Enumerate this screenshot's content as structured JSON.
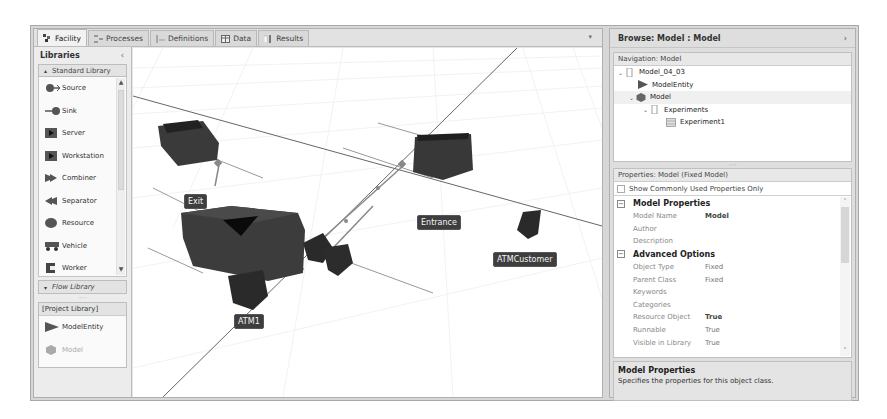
{
  "tabs": [
    {
      "label": "Facility",
      "icon": "facility-icon",
      "active": true
    },
    {
      "label": "Processes",
      "icon": "processes-icon",
      "active": false
    },
    {
      "label": "Definitions",
      "icon": "definitions-icon",
      "active": false
    },
    {
      "label": "Data",
      "icon": "data-table-icon",
      "active": false
    },
    {
      "label": "Results",
      "icon": "results-icon",
      "active": false
    }
  ],
  "tab_menu_arrow": "▾",
  "libraries": {
    "title": "Libraries",
    "collapse_glyph": "‹",
    "standard": {
      "label": "Standard Library",
      "toggle_glyph": "▴",
      "items": [
        {
          "label": "Source",
          "icon": "source-icon"
        },
        {
          "label": "Sink",
          "icon": "sink-icon"
        },
        {
          "label": "Server",
          "icon": "server-icon"
        },
        {
          "label": "Workstation",
          "icon": "workstation-icon"
        },
        {
          "label": "Combiner",
          "icon": "combiner-icon"
        },
        {
          "label": "Separator",
          "icon": "separator-icon"
        },
        {
          "label": "Resource",
          "icon": "resource-icon"
        },
        {
          "label": "Vehicle",
          "icon": "vehicle-icon"
        },
        {
          "label": "Worker",
          "icon": "worker-icon"
        }
      ]
    },
    "flow": {
      "label": "Flow Library",
      "toggle_glyph": "▾"
    },
    "grip": "·····",
    "project": {
      "label": "[Project Library]",
      "items": [
        {
          "label": "ModelEntity",
          "icon": "model-entity-icon"
        },
        {
          "label": "Model",
          "icon": "model-icon"
        }
      ]
    }
  },
  "canvas": {
    "objects": [
      {
        "label": "Exit",
        "type": "sink"
      },
      {
        "label": "Entrance",
        "type": "source"
      },
      {
        "label": "ATM1",
        "type": "server"
      },
      {
        "label": "ATMCustomer",
        "type": "entity"
      }
    ]
  },
  "browse": {
    "title": "Browse: Model : Model",
    "expand_glyph": "›",
    "navigation": {
      "header": "Navigation: Model",
      "tree": [
        {
          "label": "Model_04_03",
          "level": 0,
          "twisty": "⌄",
          "icon": "project-icon"
        },
        {
          "label": "ModelEntity",
          "level": 1,
          "twisty": "",
          "icon": "model-entity-icon"
        },
        {
          "label": "Model",
          "level": 1,
          "twisty": "⌄",
          "icon": "model-icon",
          "selected": true
        },
        {
          "label": "Experiments",
          "level": 2,
          "twisty": "⌄",
          "icon": "experiments-icon"
        },
        {
          "label": "Experiment1",
          "level": 3,
          "twisty": "",
          "icon": "experiment-icon"
        }
      ]
    },
    "properties": {
      "header": "Properties: Model (Fixed Model)",
      "show_common_label": "Show Commonly Used Properties Only",
      "show_common_checked": false,
      "categories": [
        {
          "title": "Model Properties",
          "toggle": "⊟",
          "rows": [
            {
              "name": "Model Name",
              "value": "Model",
              "bold": true
            },
            {
              "name": "Author",
              "value": ""
            },
            {
              "name": "Description",
              "value": ""
            }
          ]
        },
        {
          "title": "Advanced Options",
          "toggle": "⊟",
          "rows": [
            {
              "name": "Object Type",
              "value": "Fixed"
            },
            {
              "name": "Parent Class",
              "value": "Fixed"
            },
            {
              "name": "Keywords",
              "value": ""
            },
            {
              "name": "Categories",
              "value": ""
            },
            {
              "name": "Resource Object",
              "value": "True",
              "bold": true
            },
            {
              "name": "Runnable",
              "value": "True"
            },
            {
              "name": "Visible in Library",
              "value": "True"
            }
          ]
        }
      ],
      "scroll_up": "˄",
      "scroll_down": "˅"
    },
    "description": {
      "title": "Model Properties",
      "text": "Specifies the properties for this object class."
    }
  }
}
